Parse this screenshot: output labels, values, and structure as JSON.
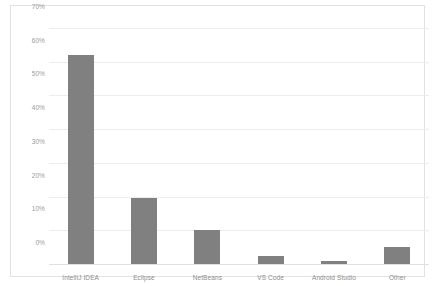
{
  "chart_data": {
    "type": "bar",
    "title": "",
    "subtitle": "",
    "xlabel": "",
    "ylabel": "",
    "categories": [
      "IntelliJ IDEA",
      "Eclipse",
      "NetBeans",
      "VS Code",
      "Android Studio",
      "Other"
    ],
    "values": [
      62,
      19.5,
      10,
      2.5,
      1,
      5
    ],
    "value_labels": [
      "62%",
      "19.5%",
      "10%",
      "2.5%",
      "1%",
      "5%"
    ],
    "ylim": [
      0,
      70
    ],
    "ytick_values": [
      0,
      10,
      20,
      30,
      40,
      50,
      60,
      70
    ],
    "ytick_labels": [
      "0%",
      "10%",
      "20%",
      "30%",
      "40%",
      "50%",
      "60%",
      "70%"
    ],
    "grid": true,
    "grid_axis": "y",
    "legend": false,
    "legend_position": "none",
    "annotations": [],
    "series": [
      {
        "name": "Share",
        "values": [
          62,
          19.5,
          10,
          2.5,
          1,
          5
        ]
      }
    ]
  },
  "style": {
    "bar_color": "#808080",
    "gridline_color": "#ededed",
    "baseline_color": "#e0e0e0",
    "frame_color": "#e2e2e2",
    "tick_label_color": "#9a9a9a",
    "category_label_color": "#8d8d8d",
    "background_color": "#ffffff"
  }
}
